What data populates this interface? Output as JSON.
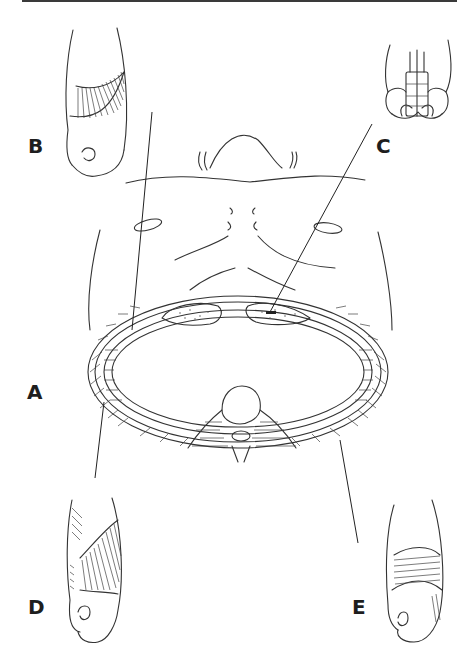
{
  "figure": {
    "type": "anatomical illustration",
    "labels": {
      "A": "A",
      "B": "B",
      "C": "C",
      "D": "D",
      "E": "E"
    },
    "panels": [
      {
        "id": "A",
        "description": "Central view: torso with transverse thoracic cross-section (ribcage, sternum, vertebra, intercostal layers)"
      },
      {
        "id": "B",
        "description": "Detail view top-left: rib segment with fanning muscle fibers"
      },
      {
        "id": "C",
        "description": "Detail view top-right: segmented rectus-like muscle over pelvis-shaped base"
      },
      {
        "id": "D",
        "description": "Detail view bottom-left: rib segment with diagonal intercostal fibers"
      },
      {
        "id": "E",
        "description": "Detail view bottom-right: rib segment with horizontal innermost fibers"
      }
    ],
    "colors": {
      "line": "#333333",
      "rule": "#3a3a3a",
      "background": "#ffffff",
      "label": "#1e1e1e"
    }
  }
}
